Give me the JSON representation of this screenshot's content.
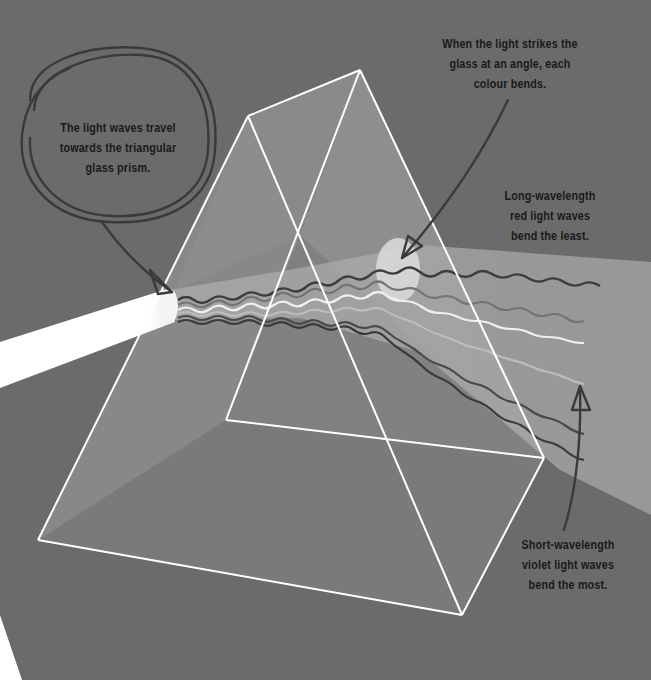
{
  "diagram": {
    "style": "grayscale illustration",
    "colors": {
      "background": "#6b6b6b",
      "prism_face": "#9a9a9a",
      "prism_edge": "#ffffff",
      "beam": "#ffffff",
      "text": "#1a1a1a",
      "annotation_stroke": "#3a3a3a"
    },
    "labels": {
      "incoming": {
        "lines": [
          "The light waves travel",
          "towards the triangular",
          "glass prism."
        ]
      },
      "strike": {
        "lines": [
          "When the light strikes the",
          "glass at an angle, each",
          "colour bends."
        ]
      },
      "red": {
        "lines": [
          "Long-wavelength",
          "red light waves",
          "bend the least."
        ]
      },
      "violet": {
        "lines": [
          "Short-wavelength",
          "violet light waves",
          "bend the most."
        ]
      }
    },
    "elements": [
      {
        "name": "white-light-beam",
        "description": "White beam entering from lower left"
      },
      {
        "name": "glass-prism",
        "description": "3D triangular prism outlined in white"
      },
      {
        "name": "dispersed-spectrum",
        "description": "Wavy light waves fanning out to the right"
      },
      {
        "name": "circle-annotation",
        "description": "Hand-drawn circle around incoming label"
      },
      {
        "name": "arrow-annotations",
        "description": "Hand-drawn arrows pointing to beam entry, refraction point, and violet waves"
      }
    ]
  }
}
